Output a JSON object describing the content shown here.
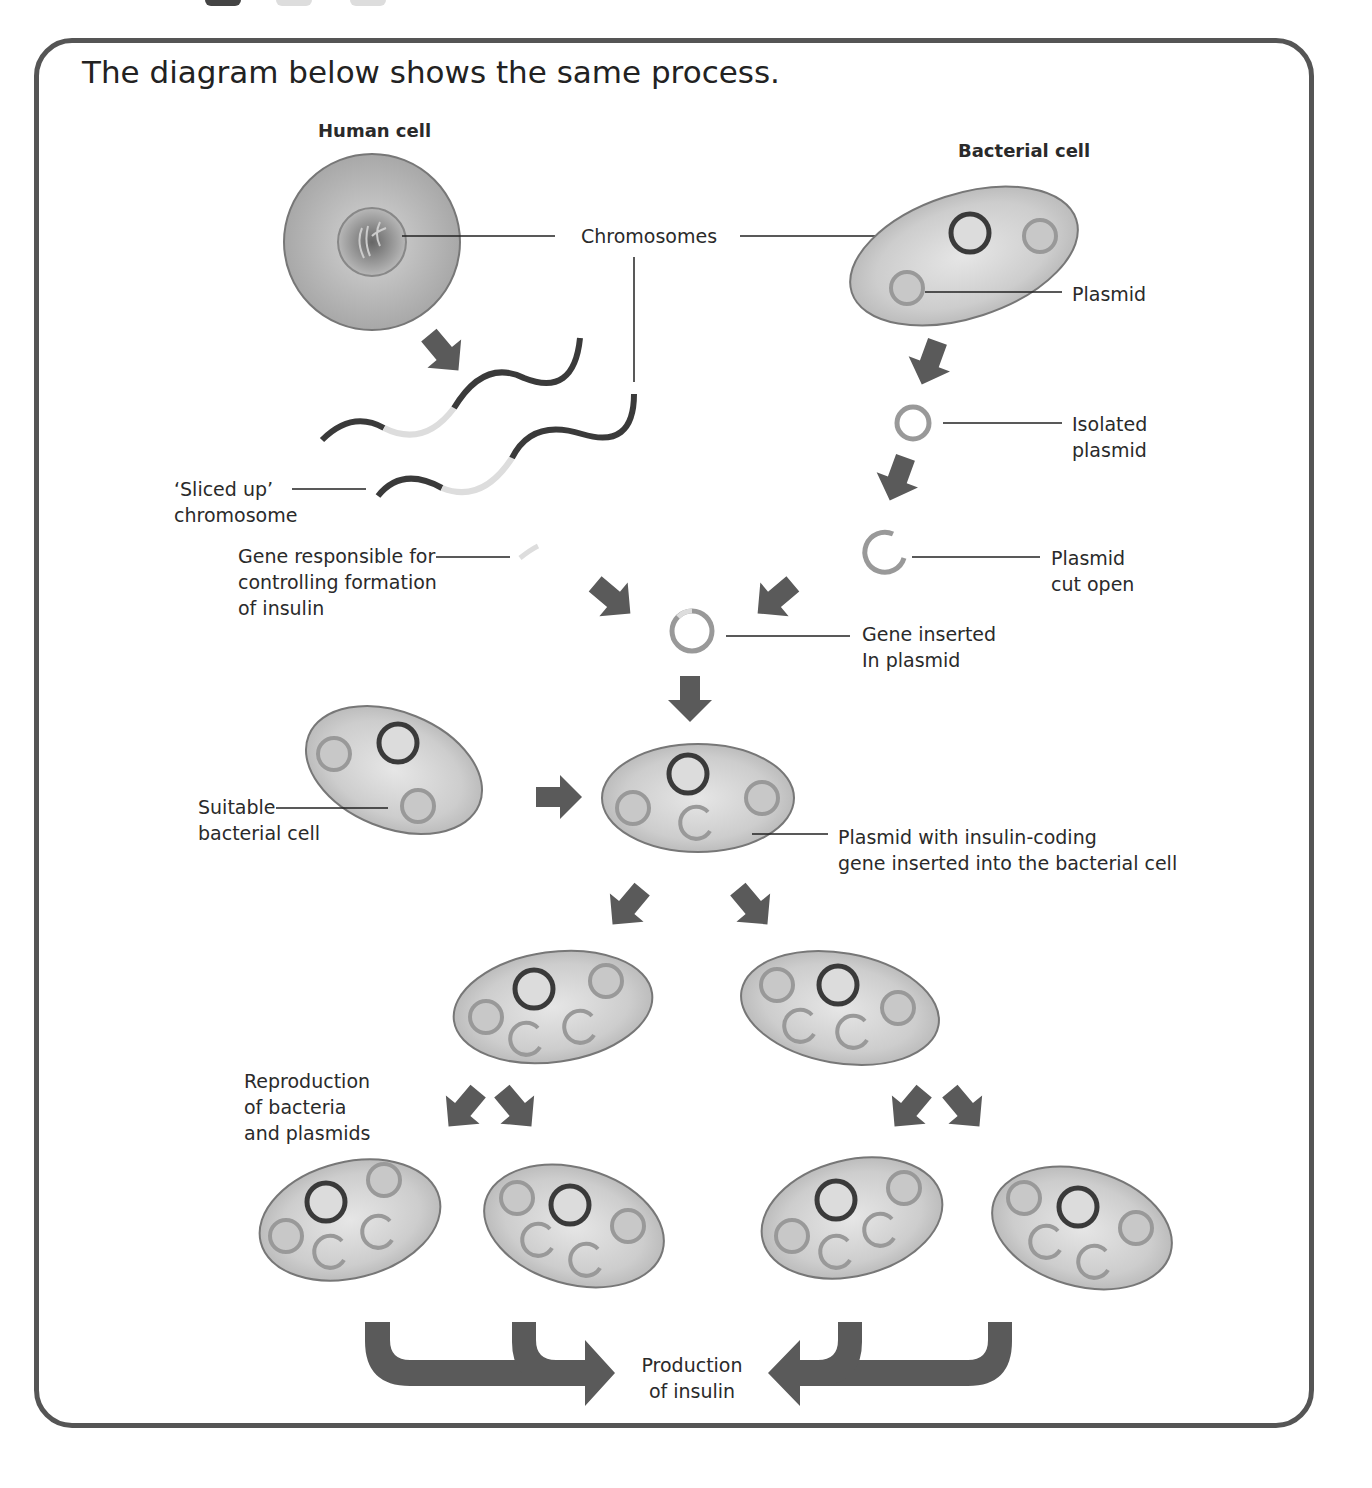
{
  "heading": "The diagram below shows the same process.",
  "labels": {
    "human_cell": "Human cell",
    "bacterial_cell": "Bacterial cell",
    "chromosomes": "Chromosomes",
    "plasmid": "Plasmid",
    "sliced_up_1": "‘Sliced up’",
    "sliced_up_2": "chromosome",
    "gene_1": "Gene responsible for",
    "gene_2": "controlling formation",
    "gene_3": "of insulin",
    "isolated_1": "Isolated",
    "isolated_2": "plasmid",
    "cut_1": "Plasmid",
    "cut_2": "cut open",
    "inserted_1": "Gene inserted",
    "inserted_2": "In plasmid",
    "suitable_1": "Suitable",
    "suitable_2": "bacterial cell",
    "with_gene_1": "Plasmid with insulin-coding",
    "with_gene_2": "gene inserted into the bacterial cell",
    "repro_1": "Reproduction",
    "repro_2": "of bacteria",
    "repro_3": "and plasmids",
    "production_1": "Production",
    "production_2": "of insulin"
  },
  "colors": {
    "frame": "#555555",
    "arrow": "#5a5a5a",
    "cell_fill": "#cfcfcf",
    "chromosome": "#3a3a3a",
    "plasmid_ring": "#9a9a9a"
  }
}
